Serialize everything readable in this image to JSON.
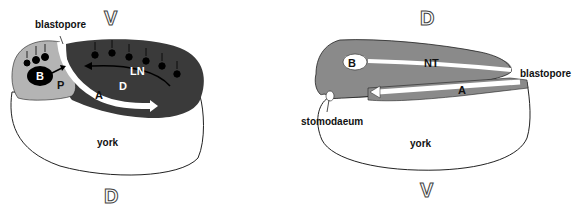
{
  "left_panel": {
    "top_axis": "V",
    "bottom_axis": "D",
    "labels": {
      "blastopore": "blastopore",
      "B": "B",
      "P": "P",
      "LN": "LN",
      "D": "D",
      "A": "A",
      "yolk": "york"
    }
  },
  "right_panel": {
    "top_axis": "D",
    "bottom_axis": "V",
    "labels": {
      "B": "B",
      "NT": "NT",
      "blastopore": "blastopore",
      "A": "A",
      "stomodaeum": "stomodaeum",
      "yolk": "york"
    }
  },
  "colors": {
    "dark_tissue": "#3a3a3a",
    "medium_tissue": "#8a8a8a",
    "light_tissue": "#b4b4b4",
    "yolk": "#ffffff",
    "outline": "#222222"
  }
}
